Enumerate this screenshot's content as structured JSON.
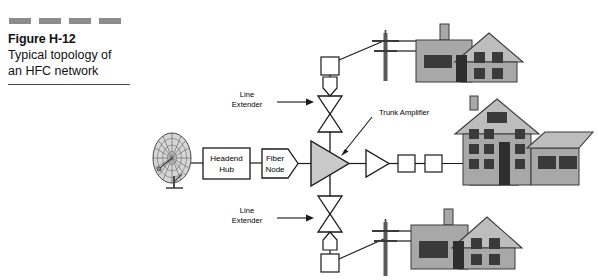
{
  "figure": {
    "title": "Figure H-12",
    "caption_line1": "Typical topology of",
    "caption_line2": "an HFC network",
    "decoration": "four-dash-rule"
  },
  "diagram": {
    "nodes": {
      "satellite_dish": "satellite-dish",
      "headend_line1": "Headend",
      "headend_line2": "Hub",
      "fiber_line1": "Fiber",
      "fiber_line2": "Node"
    },
    "labels": {
      "trunk_amplifier": "Trunk Amplifier",
      "line_extender_upper_l1": "Line",
      "line_extender_upper_l2": "Extender",
      "line_extender_lower_l1": "Line",
      "line_extender_lower_l2": "Extender"
    },
    "colors": {
      "line": "#1a1a1a",
      "amp_fill": "#c9c9c9",
      "house_wall": "#a8a8a8",
      "house_roof": "#bdbdbd",
      "window": "#3a3a3a",
      "dash_gray": "#8c8c8c",
      "pole": "#5a5a5a"
    }
  }
}
